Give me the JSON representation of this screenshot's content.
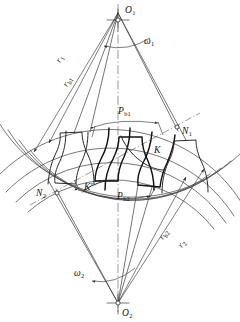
{
  "figure": {
    "background_color": "#ffffff",
    "line_color": "#3a3a3a",
    "tooth_color": "#111111"
  },
  "centers": {
    "upper": {
      "label": "O",
      "sub": "1",
      "x": 118,
      "y": 13
    },
    "lower": {
      "label": "O",
      "sub": "2",
      "x": 118,
      "y": 303
    }
  },
  "labels": {
    "omega1": {
      "label": "ω",
      "sub": "1",
      "x": 143,
      "y": 44
    },
    "omega2": {
      "label": "ω",
      "sub": "2",
      "x": 76,
      "y": 276
    },
    "r1": {
      "label": "r",
      "sub": "1",
      "x": 63,
      "y": 61,
      "rotate": -62
    },
    "rb1": {
      "label": "r",
      "sub": "b1",
      "x": 70,
      "y": 84,
      "rotate": -62
    },
    "rb2": {
      "label": "r",
      "sub": "b2",
      "x": 166,
      "y": 237,
      "rotate": 60
    },
    "r2": {
      "label": "r",
      "sub": "2",
      "x": 185,
      "y": 245,
      "rotate": 60
    },
    "N1": {
      "label": "N",
      "sub": "1",
      "x": 182,
      "y": 131
    },
    "N2": {
      "label": "N",
      "sub": "2",
      "x": 40,
      "y": 196
    },
    "K": {
      "label": "K",
      "sub": "",
      "x": 155,
      "y": 152
    },
    "Kprime": {
      "label": "K′",
      "sub": "",
      "x": 85,
      "y": 189
    },
    "Pb1": {
      "label": "P",
      "sub": "b1",
      "x": 120,
      "y": 114
    },
    "Pb2": {
      "label": "P",
      "sub": "b2",
      "x": 119,
      "y": 199
    }
  },
  "geometry": {
    "upper_center": [
      118,
      13
    ],
    "lower_center": [
      118,
      303
    ],
    "r1_pitch": 146,
    "rb1_base": 137,
    "ra1_addendum": 156,
    "r2_pitch": 146,
    "rb2_base": 137,
    "ra2_addendum": 156,
    "pressure_angle_deg": 20,
    "pitch_point": [
      118,
      159
    ],
    "N1_point": [
      177,
      127
    ],
    "N2_point": [
      57,
      193
    ]
  }
}
